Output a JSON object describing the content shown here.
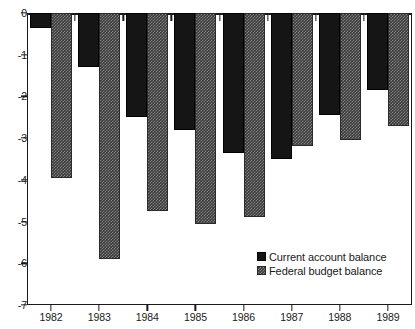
{
  "chart_data": {
    "type": "bar",
    "title": "",
    "subtitle": "",
    "xlabel": "",
    "ylabel": "",
    "categories": [
      "1982",
      "1983",
      "1984",
      "1985",
      "1986",
      "1987",
      "1988",
      "1989"
    ],
    "series": [
      {
        "name": "Current account balance",
        "color": "#151515",
        "values": [
          -0.35,
          -1.3,
          -2.5,
          -2.8,
          -3.35,
          -3.5,
          -2.45,
          -1.85
        ]
      },
      {
        "name": "Federal budget balance",
        "color": "#3b3b3b",
        "values": [
          -3.95,
          -5.9,
          -4.75,
          -5.05,
          -4.9,
          -3.2,
          -3.05,
          -2.7
        ]
      }
    ],
    "ylim": [
      -7,
      0
    ],
    "yticks": [
      0,
      -1,
      -2,
      -3,
      -4,
      -5,
      -6,
      -7
    ],
    "ytick_labels": [
      "0",
      "-1",
      "-2",
      "-3",
      "-4",
      "-5",
      "-6",
      "-7"
    ],
    "xtick_labels": [
      "1982",
      "1983",
      "1984",
      "1985",
      "1986",
      "1987",
      "1988",
      "1989"
    ],
    "grid": false,
    "legend_position": "inside-bottom-right",
    "legend_entries": [
      "Current account balance",
      "Federal budget balance"
    ],
    "orientation": "vertical",
    "bars_point": "down"
  },
  "legend": {
    "items": [
      {
        "label": "Current account balance",
        "swatch": "solid-black-swatch"
      },
      {
        "label": "Federal budget balance",
        "swatch": "hatched-grey-swatch"
      }
    ]
  }
}
